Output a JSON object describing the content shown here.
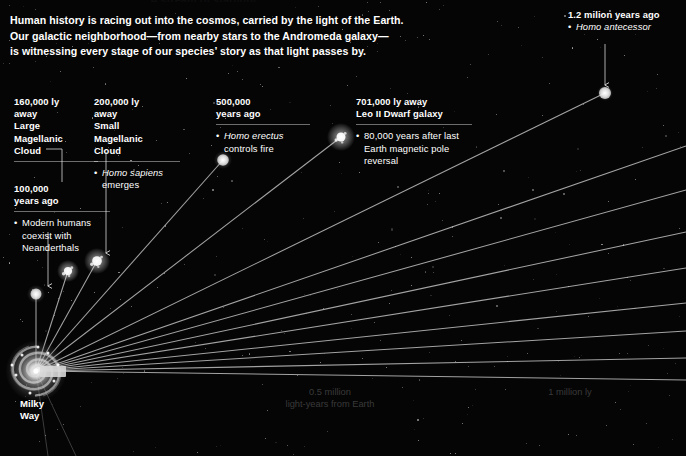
{
  "meta": {
    "width": 686,
    "height": 456,
    "background_color": "#050505",
    "text_color": "#ffffff",
    "dim_text_color": "#3a3a3a",
    "line_color": "#cfcfcf"
  },
  "cut_title": "A stream of starlight",
  "intro": {
    "lines": [
      "Human history is racing out into the cosmos, carried by the light of the Earth.",
      "Our galactic neighborhood—from nearby stars to the Andromeda galaxy—",
      "is witnessing every stage of our species’ story as that light passes by."
    ]
  },
  "milky_way": {
    "caption_lines": [
      "Milky",
      "Way"
    ],
    "center_x": 36,
    "center_y": 371
  },
  "axis_labels": [
    {
      "name": "half-million-ly",
      "lines": [
        "0.5 million",
        "light-years from Earth"
      ],
      "x": 330,
      "y": 386
    },
    {
      "name": "one-million-ly",
      "lines": [
        "1 million ly"
      ],
      "x": 570,
      "y": 386
    }
  ],
  "annotations": [
    {
      "id": "large-magellanic-cloud",
      "header_lines": [
        "160,000 ly",
        "away",
        "Large",
        "Magellanic",
        "Cloud"
      ],
      "bullet": null,
      "bullet_italic": null,
      "x": 14,
      "y": 96,
      "width": 84,
      "rule": true
    },
    {
      "id": "modern-humans",
      "header_lines": [
        "100,000",
        "years ago"
      ],
      "bullet": "Modern humans coexist with Neanderthals",
      "bullet_italic": null,
      "x": 14,
      "y": 183,
      "width": 96,
      "rule": true
    },
    {
      "id": "small-magellanic-cloud",
      "header_lines": [
        "200,000 ly",
        "away",
        "Small",
        "Magellanic",
        "Cloud"
      ],
      "bullet": "emerges",
      "bullet_italic": "Homo sapiens",
      "x": 94,
      "y": 96,
      "width": 86,
      "rule": true
    },
    {
      "id": "homo-erectus",
      "header_lines": [
        "500,000",
        "years ago"
      ],
      "bullet": "controls fire",
      "bullet_italic": "Homo erectus",
      "x": 216,
      "y": 96,
      "width": 94,
      "rule": true
    },
    {
      "id": "leo-ii-dwarf",
      "header_lines": [
        "701,000 ly away",
        "Leo II Dwarf galaxy"
      ],
      "bullet": "80,000 years after last Earth magnetic pole reversal",
      "bullet_italic": null,
      "x": 356,
      "y": 96,
      "width": 116,
      "rule": true
    },
    {
      "id": "homo-antecessor",
      "header_lines": [
        "1.2 milion years ago"
      ],
      "bullet": "Homo antecessor",
      "bullet_italic": "Homo antecessor",
      "x": 568,
      "y": 9,
      "width": 118,
      "rule": false
    }
  ],
  "galaxy_markers": [
    {
      "id": "lmc-marker",
      "name": "large-magellanic-cloud-marker",
      "x": 36,
      "y": 294,
      "r": 5.5,
      "glow": 9,
      "type": "dot"
    },
    {
      "id": "smc-marker",
      "name": "small-magellanic-cloud-marker",
      "x": 68,
      "y": 271,
      "r": 5.5,
      "glow": 11,
      "type": "fuzzy"
    },
    {
      "id": "sgr-marker",
      "name": "sagittarius-dwarf-marker",
      "x": 97,
      "y": 261,
      "r": 6.5,
      "glow": 13,
      "type": "fuzzy"
    },
    {
      "id": "erectus-marker",
      "name": "homo-erectus-marker",
      "x": 223,
      "y": 160,
      "r": 5.8,
      "glow": 9,
      "type": "dot"
    },
    {
      "id": "leo2-marker",
      "name": "leo-ii-dwarf-marker",
      "x": 341,
      "y": 137,
      "r": 6.0,
      "glow": 14,
      "type": "fuzzy"
    },
    {
      "id": "antecessor-marker",
      "name": "homo-antecessor-marker",
      "x": 605,
      "y": 93,
      "r": 6.0,
      "glow": 8,
      "type": "dot"
    }
  ],
  "light_rays": [
    {
      "id": "ray-1",
      "x2": 605,
      "y2": 93
    },
    {
      "id": "ray-2",
      "x2": 686,
      "y2": 146
    },
    {
      "id": "ray-3",
      "x2": 686,
      "y2": 190
    },
    {
      "id": "ray-4",
      "x2": 686,
      "y2": 232
    },
    {
      "id": "ray-5",
      "x2": 686,
      "y2": 268
    },
    {
      "id": "ray-6",
      "x2": 686,
      "y2": 303
    },
    {
      "id": "ray-7",
      "x2": 686,
      "y2": 331
    },
    {
      "id": "ray-8",
      "x2": 686,
      "y2": 358
    },
    {
      "id": "ray-9",
      "x2": 686,
      "y2": 380
    },
    {
      "id": "ray-10",
      "x2": 341,
      "y2": 137
    },
    {
      "id": "ray-11",
      "x2": 223,
      "y2": 160
    },
    {
      "id": "ray-12",
      "x2": 97,
      "y2": 261
    },
    {
      "id": "ray-13",
      "x2": 68,
      "y2": 271
    },
    {
      "id": "ray-14",
      "x2": 36,
      "y2": 294
    }
  ],
  "down_rays": [
    {
      "id": "down-ray-1",
      "x2": 48,
      "y2": 456
    },
    {
      "id": "down-ray-2",
      "x2": 76,
      "y2": 456
    }
  ],
  "connector_arrows": [
    {
      "id": "arrow-lmc",
      "name": "connector-large-magellanic-cloud",
      "x1": 62,
      "y1": 149,
      "x2": 62,
      "y2": 182,
      "elbow_x": 46
    },
    {
      "id": "arrow-modern",
      "name": "connector-modern-humans",
      "x1": 48,
      "y1": 232,
      "x2": 48,
      "y2": 286
    },
    {
      "id": "arrow-smc",
      "name": "connector-small-magellanic-cloud",
      "x1": 106,
      "y1": 152,
      "x2": 106,
      "y2": 253
    },
    {
      "id": "arrow-antecessor",
      "name": "connector-homo-antecessor",
      "x1": 605,
      "y1": 44,
      "x2": 605,
      "y2": 85
    }
  ]
}
